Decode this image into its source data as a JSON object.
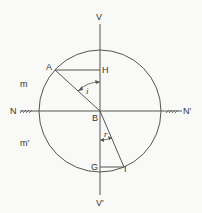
{
  "diagram": {
    "labels": {
      "v_top": "V",
      "v_bottom": "V′",
      "n_left": "N",
      "n_right": "N′",
      "a": "A",
      "h": "H",
      "b": "B",
      "g": "G",
      "i_point": "I",
      "angle_incidence": "i",
      "angle_refraction": "r",
      "medium_top": "m",
      "medium_bottom": "m′"
    },
    "colors": {
      "line": "#444444",
      "background": "#f9f9f7"
    }
  }
}
